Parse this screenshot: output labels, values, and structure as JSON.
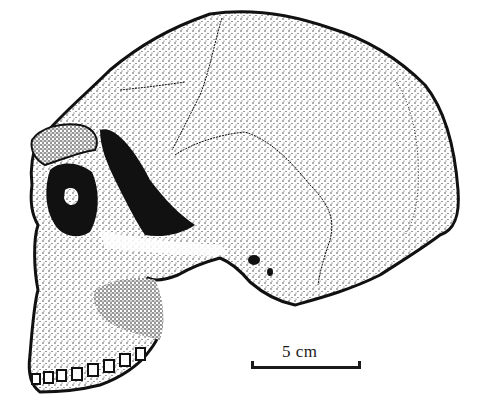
{
  "figure": {
    "style": "stipple-illustration",
    "colors": {
      "ink": "#1a1a1a",
      "background": "#ffffff"
    }
  },
  "scale_bar": {
    "label": "5 cm",
    "length_cm": 5
  }
}
